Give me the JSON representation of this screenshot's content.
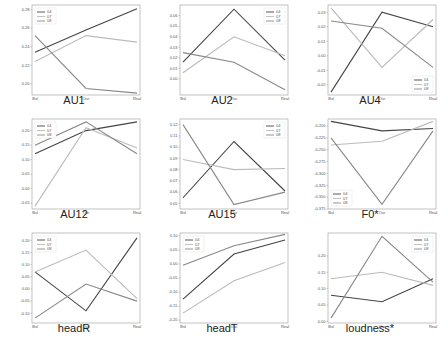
{
  "series_names": [
    "04",
    "07",
    "08"
  ],
  "series_colors": [
    "#444444",
    "#bbbbbb",
    "#888888"
  ],
  "x_ticks": [
    "Bsl",
    "Our",
    "Real"
  ],
  "chart_data": [
    {
      "type": "line",
      "title": "AU1",
      "categories": [
        "Bsl",
        "Our",
        "Real"
      ],
      "yticks": [
        "0.20",
        "0.22",
        "0.24",
        "0.26",
        "0.28"
      ],
      "ylim": [
        0.188,
        0.285
      ],
      "legend": "upper left",
      "series": [
        {
          "name": "04",
          "values": [
            0.234,
            0.258,
            0.281
          ]
        },
        {
          "name": "07",
          "values": [
            0.224,
            0.252,
            0.245
          ]
        },
        {
          "name": "08",
          "values": [
            0.252,
            0.195,
            0.19
          ]
        }
      ]
    },
    {
      "type": "line",
      "title": "AU2",
      "categories": [
        "Bsl",
        "Our",
        "Real"
      ],
      "yticks": [
        "0.00",
        "0.01",
        "0.02",
        "0.03",
        "0.04",
        "0.05",
        "0.06"
      ],
      "ylim": [
        -0.015,
        0.07
      ],
      "legend": "upper right",
      "series": [
        {
          "name": "04",
          "values": [
            0.016,
            0.066,
            0.018
          ]
        },
        {
          "name": "07",
          "values": [
            0.006,
            0.04,
            0.022
          ]
        },
        {
          "name": "08",
          "values": [
            0.025,
            0.016,
            -0.01
          ]
        }
      ]
    },
    {
      "type": "line",
      "title": "AU4",
      "categories": [
        "Bsl",
        "Our",
        "Real"
      ],
      "yticks": [
        "-0.02",
        "-0.01",
        "0.00",
        "0.01",
        "0.02",
        "0.03"
      ],
      "ylim": [
        -0.027,
        0.035
      ],
      "legend": "lower right",
      "series": [
        {
          "name": "04",
          "values": [
            -0.025,
            0.03,
            0.02
          ]
        },
        {
          "name": "07",
          "values": [
            0.033,
            -0.008,
            0.025
          ]
        },
        {
          "name": "08",
          "values": [
            0.024,
            0.019,
            -0.008
          ]
        }
      ]
    },
    {
      "type": "line",
      "title": "AU12",
      "categories": [
        "Bsl",
        "Our",
        "Real"
      ],
      "yticks": [
        "-0.05",
        "0.00",
        "0.05",
        "0.10",
        "0.15",
        "0.20"
      ],
      "ylim": [
        -0.07,
        0.24
      ],
      "legend": "upper left",
      "series": [
        {
          "name": "04",
          "values": [
            0.12,
            0.2,
            0.23
          ]
        },
        {
          "name": "07",
          "values": [
            -0.06,
            0.21,
            0.14
          ]
        },
        {
          "name": "08",
          "values": [
            0.15,
            0.23,
            0.12
          ]
        }
      ]
    },
    {
      "type": "line",
      "title": "AU15",
      "categories": [
        "Bsl",
        "Our",
        "Real"
      ],
      "yticks": [
        "0.05",
        "0.06",
        "0.07",
        "0.08",
        "0.09",
        "0.10",
        "0.11",
        "0.12"
      ],
      "ylim": [
        0.045,
        0.125
      ],
      "legend": "upper right",
      "series": [
        {
          "name": "04",
          "values": [
            0.055,
            0.105,
            0.061
          ]
        },
        {
          "name": "07",
          "values": [
            0.089,
            0.08,
            0.081
          ]
        },
        {
          "name": "08",
          "values": [
            0.12,
            0.049,
            0.06
          ]
        }
      ]
    },
    {
      "type": "line",
      "title": "F0*",
      "categories": [
        "Bsl",
        "Our",
        "Real"
      ],
      "yticks": [
        "-0.200",
        "-0.225",
        "-0.250",
        "-0.275",
        "-0.300",
        "-0.325",
        "-0.350",
        "-0.375"
      ],
      "ylim": [
        -0.375,
        -0.185
      ],
      "legend": "lower left",
      "series": [
        {
          "name": "04",
          "values": [
            -0.19,
            -0.21,
            -0.205
          ]
        },
        {
          "name": "07",
          "values": [
            -0.24,
            -0.232,
            -0.19
          ]
        },
        {
          "name": "08",
          "values": [
            -0.225,
            -0.365,
            -0.21
          ]
        }
      ]
    },
    {
      "type": "line",
      "title": "headR",
      "categories": [
        "Bsl",
        "Our",
        "Real"
      ],
      "yticks": [
        "-0.10",
        "-0.05",
        "0.00",
        "0.05",
        "0.10",
        "0.15",
        "0.20"
      ],
      "ylim": [
        -0.14,
        0.23
      ],
      "legend": "upper left",
      "series": [
        {
          "name": "04",
          "values": [
            0.07,
            -0.09,
            0.21
          ]
        },
        {
          "name": "07",
          "values": [
            0.07,
            0.16,
            -0.04
          ]
        },
        {
          "name": "08",
          "values": [
            -0.12,
            0.02,
            -0.05
          ]
        }
      ]
    },
    {
      "type": "line",
      "title": "headT",
      "categories": [
        "Bsl",
        "Our",
        "Real"
      ],
      "yticks": [
        "-0.20",
        "-0.15",
        "-0.10",
        "-0.05",
        "0.00",
        "0.05",
        "0.10"
      ],
      "ylim": [
        -0.21,
        0.11
      ],
      "legend": "upper left",
      "series": [
        {
          "name": "04",
          "values": [
            -0.125,
            0.035,
            0.085
          ]
        },
        {
          "name": "07",
          "values": [
            -0.175,
            -0.06,
            0.005
          ]
        },
        {
          "name": "08",
          "values": [
            -0.005,
            0.065,
            0.105
          ]
        }
      ]
    },
    {
      "type": "line",
      "title": "loudness*",
      "categories": [
        "Bsl",
        "Our",
        "Real"
      ],
      "yticks": [
        "0.00",
        "0.05",
        "0.10",
        "0.15",
        "0.20"
      ],
      "ylim": [
        -0.005,
        0.27
      ],
      "legend": "upper right",
      "series": [
        {
          "name": "04",
          "values": [
            0.08,
            0.06,
            0.13
          ]
        },
        {
          "name": "07",
          "values": [
            0.13,
            0.15,
            0.11
          ]
        },
        {
          "name": "08",
          "values": [
            0.01,
            0.26,
            0.12
          ]
        }
      ]
    }
  ]
}
